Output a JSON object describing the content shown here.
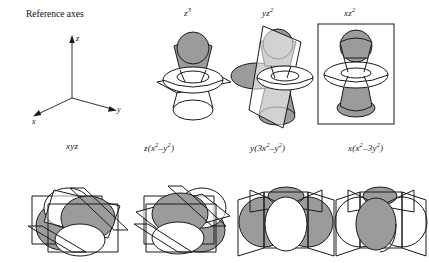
{
  "figure": {
    "title_text": "Reference axes",
    "axes": {
      "z_label": "z",
      "y_label": "y",
      "x_label": "x"
    },
    "shading": {
      "positive_lobe_color": "#9b9b9b",
      "negative_lobe_color": "#ffffff",
      "outline_color": "#1a1a1a",
      "background": "#ffffff"
    },
    "rows": [
      {
        "name": "top-row",
        "orbitals": [
          {
            "id": "z3",
            "base": "z",
            "sup": "3",
            "paren": "",
            "label_plain": "z3",
            "style": "torus-with-axial-lobes",
            "nodal_planes": 1,
            "plane_type": "horizontal-parallelogram"
          },
          {
            "id": "yz2",
            "base": "yz",
            "sup": "2",
            "paren": "",
            "label_plain": "yz2",
            "style": "torus-with-axial-lobes",
            "nodal_planes": 1,
            "plane_type": "vertical-tilted"
          },
          {
            "id": "xz2",
            "base": "xz",
            "sup": "2",
            "paren": "",
            "label_plain": "xz2",
            "style": "torus-with-axial-lobes",
            "nodal_planes": 1,
            "plane_type": "vertical-rectangle"
          }
        ]
      },
      {
        "name": "bottom-row",
        "orbitals": [
          {
            "id": "xyz",
            "label_plain": "xyz",
            "style": "eight-lobe-cubic",
            "nodal_planes": 3,
            "plane_type": "three-intersecting"
          },
          {
            "id": "zx2-y2",
            "label_plain": "z(x2-y2)",
            "style": "eight-lobe-cubic",
            "nodal_planes": 3,
            "plane_type": "three-intersecting"
          },
          {
            "id": "y3x2-y2",
            "label_plain": "y(3x2-y2)",
            "style": "six-lobe-vertical",
            "nodal_planes": 3,
            "plane_type": "vertical-fan"
          },
          {
            "id": "xx2-3y2",
            "label_plain": "x(x2-3y2)",
            "style": "six-lobe-vertical",
            "nodal_planes": 3,
            "plane_type": "vertical-fan"
          }
        ]
      }
    ],
    "labels": {
      "z3": {
        "html_parts": [
          "z",
          "3"
        ]
      },
      "yz2": {
        "html_parts": [
          "yz",
          "2"
        ]
      },
      "xz2": {
        "html_parts": [
          "xz",
          "2"
        ]
      },
      "xyz": {
        "text": "xyz"
      },
      "zx2y2": {
        "pre": "z(x",
        "sup1": "2",
        "mid": "–y",
        "sup2": "2",
        "post": ")"
      },
      "y3x2y2": {
        "pre": "y(3x",
        "sup1": "2",
        "mid": "–y",
        "sup2": "2",
        "post": ")"
      },
      "xx23y2": {
        "pre": "x(x",
        "sup1": "2",
        "mid": "–3y",
        "sup2": "2",
        "post": ")"
      }
    }
  }
}
